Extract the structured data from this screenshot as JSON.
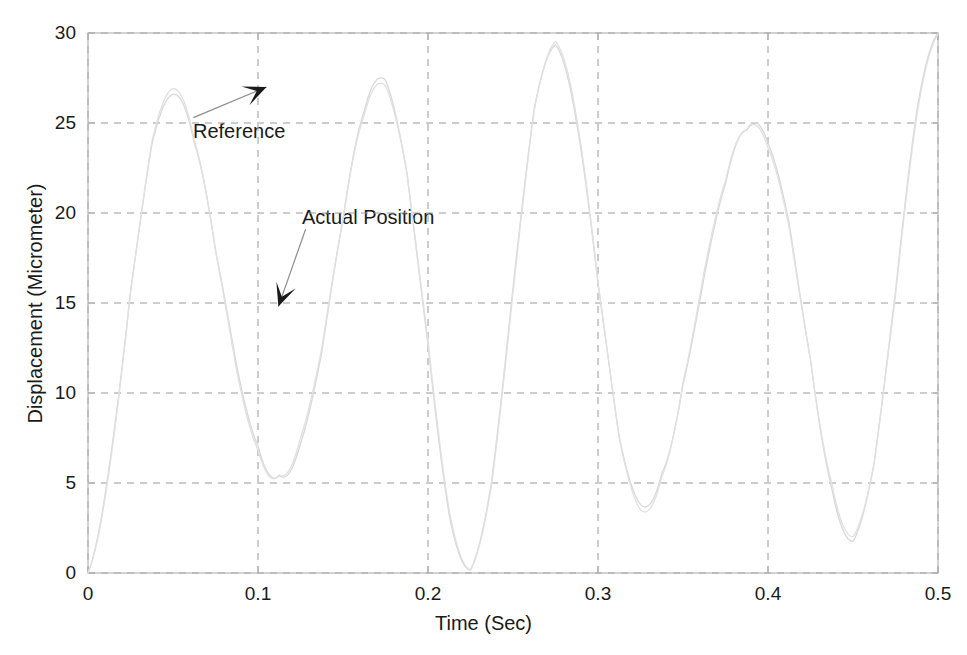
{
  "figure": {
    "background_color": "#ffffff",
    "axes_color": "#b0b0b0",
    "grid_color": "#9a9a9a",
    "curve_reference_color": "#d8d8d8",
    "curve_actual_color": "#e0e0e0",
    "annotation_color": "#1a1a1a"
  },
  "axis": {
    "x_label": "Time (Sec)",
    "y_label": "Displacement (Micrometer)",
    "x_ticks": [
      "0",
      "0.1",
      "0.2",
      "0.3",
      "0.4",
      "0.5"
    ],
    "y_ticks": [
      "0",
      "5",
      "10",
      "15",
      "20",
      "25",
      "30"
    ]
  },
  "annotations": [
    {
      "name": "reference",
      "label": "Reference"
    },
    {
      "name": "actual-position",
      "label": "Actual Position"
    }
  ],
  "chart_data": {
    "type": "line",
    "title": "",
    "xlabel": "Time (Sec)",
    "ylabel": "Displacement (Micrometer)",
    "xlim": [
      0,
      0.5
    ],
    "ylim": [
      0,
      30
    ],
    "xticks": [
      0,
      0.1,
      0.2,
      0.3,
      0.4,
      0.5
    ],
    "yticks": [
      0,
      5,
      10,
      15,
      20,
      25,
      30
    ],
    "grid": true,
    "grid_style": "dashed",
    "legend": "none (inline annotated labels with arrows)",
    "annotations": [
      {
        "text": "Reference",
        "text_xy": [
          0.062,
          25.3
        ],
        "arrow_tip_xy": [
          0.105,
          27.0
        ],
        "arrow_direction": "up-right"
      },
      {
        "text": "Actual Position",
        "text_xy": [
          0.128,
          19.1
        ],
        "arrow_tip_xy": [
          0.112,
          14.8
        ],
        "arrow_direction": "down-left"
      }
    ],
    "waveform": {
      "description": "Rectified / offset sinusoidal tracking signal oscillating between 0 and 30 micrometers",
      "amplitude": 15,
      "offset": 15,
      "period_sec": 0.111,
      "frequency_hz": 9.0,
      "phase_deg": -90,
      "cycles_shown": 4.5,
      "peaks_t": [
        0.0255,
        0.1365,
        0.2475,
        0.3585,
        0.4695
      ],
      "peaks_y": [
        30,
        30,
        30,
        30,
        30
      ],
      "troughs_t": [
        0.081,
        0.192,
        0.303,
        0.414
      ],
      "troughs_y": [
        0,
        0,
        0,
        0
      ]
    },
    "series": [
      {
        "name": "Reference",
        "color": "#d8d8d8",
        "linestyle": "solid",
        "x": [
          0,
          0.0125,
          0.025,
          0.0375,
          0.05,
          0.0625,
          0.075,
          0.0875,
          0.1,
          0.1125,
          0.125,
          0.1375,
          0.15,
          0.1625,
          0.175,
          0.1875,
          0.2,
          0.2125,
          0.225,
          0.2375,
          0.25,
          0.2625,
          0.275,
          0.2875,
          0.3,
          0.3125,
          0.325,
          0.3375,
          0.35,
          0.3625,
          0.375,
          0.3875,
          0.4,
          0.4125,
          0.425,
          0.4375,
          0.45,
          0.4625,
          0.475,
          0.4875,
          0.5
        ],
        "y": [
          0.0,
          16.7,
          29.2,
          27.9,
          14.3,
          1.4,
          0.6,
          11.9,
          26.4,
          29.9,
          19.6,
          4.5,
          0.0,
          7.6,
          23.2,
          30.0,
          23.9,
          8.2,
          0.0,
          4.0,
          18.8,
          29.8,
          27.0,
          12.6,
          0.9,
          0.9,
          14.3,
          28.5,
          28.9,
          16.4,
          2.3,
          0.2,
          9.9,
          25.1,
          30.0,
          21.6,
          5.9,
          0.0,
          6.1,
          21.0,
          30.0
        ]
      },
      {
        "name": "Actual Position",
        "color": "#e0e0e0",
        "linestyle": "solid",
        "x": [
          0,
          0.0125,
          0.025,
          0.0375,
          0.05,
          0.0625,
          0.075,
          0.0875,
          0.1,
          0.1125,
          0.125,
          0.1375,
          0.15,
          0.1625,
          0.175,
          0.1875,
          0.2,
          0.2125,
          0.225,
          0.2375,
          0.25,
          0.2625,
          0.275,
          0.2875,
          0.3,
          0.3125,
          0.325,
          0.3375,
          0.35,
          0.3625,
          0.375,
          0.3875,
          0.4,
          0.4125,
          0.425,
          0.4375,
          0.45,
          0.4625,
          0.475,
          0.4875,
          0.5
        ],
        "y": [
          0.0,
          15.4,
          28.6,
          28.8,
          16.1,
          2.2,
          0.2,
          10.2,
          25.2,
          30.0,
          21.4,
          5.8,
          0.0,
          6.3,
          21.4,
          29.9,
          25.4,
          9.6,
          0.0,
          2.9,
          17.2,
          29.3,
          28.1,
          14.2,
          1.4,
          0.5,
          12.6,
          27.5,
          29.6,
          18.1,
          3.3,
          0.0,
          8.5,
          23.7,
          30.0,
          23.1,
          7.3,
          0.0,
          4.9,
          19.5,
          29.6
        ]
      }
    ]
  }
}
